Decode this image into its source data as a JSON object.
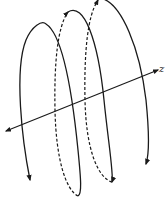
{
  "figure": {
    "axis": {
      "label": "z",
      "bidirectional_arrows": true
    },
    "helix": {
      "turns": 3,
      "front_segments": "solid",
      "back_segments": "dashed",
      "direction_arrows": true
    },
    "colors": {
      "stroke": "#1a1a1a",
      "background": "#ffffff"
    }
  }
}
